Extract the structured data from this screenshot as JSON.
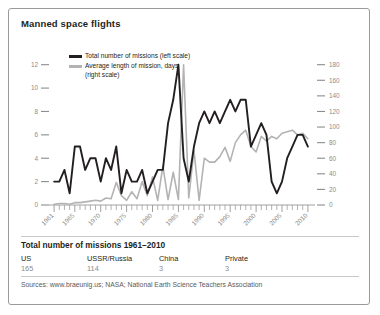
{
  "card": {
    "title": "Manned space flights"
  },
  "legend": {
    "series": [
      {
        "label": "Total number of missions (left scale)",
        "color": "#231f20",
        "swatch": "black"
      },
      {
        "label": "Average length of mission, days\n(right scale)",
        "color": "#b3b3b3",
        "swatch": "gray"
      }
    ]
  },
  "footer": {
    "summary_title": "Total number of missions 1961–2010",
    "columns": [
      {
        "label": "US",
        "value": "165"
      },
      {
        "label": "USSR/Russia",
        "value": "114"
      },
      {
        "label": "China",
        "value": "3"
      },
      {
        "label": "Private",
        "value": "3"
      }
    ],
    "sources": "Sources: www.braeunig.us; NASA; National Earth Science Teachers Association"
  },
  "chart_data": {
    "type": "line",
    "title": "Manned space flights",
    "xlabel": "",
    "ylabel": "",
    "grid": false,
    "legend_position": "top-left",
    "x": [
      1961,
      1962,
      1963,
      1964,
      1965,
      1966,
      1967,
      1968,
      1969,
      1970,
      1971,
      1972,
      1973,
      1974,
      1975,
      1976,
      1977,
      1978,
      1979,
      1980,
      1981,
      1982,
      1983,
      1984,
      1985,
      1986,
      1987,
      1988,
      1989,
      1990,
      1991,
      1992,
      1993,
      1994,
      1995,
      1996,
      1997,
      1998,
      1999,
      2000,
      2001,
      2002,
      2003,
      2004,
      2005,
      2006,
      2007,
      2008,
      2009,
      2010
    ],
    "xticks": [
      1961,
      1965,
      1970,
      1975,
      1980,
      1985,
      1990,
      1995,
      2000,
      2005,
      2010
    ],
    "xtick_labels": [
      "1961",
      "1965",
      "1970",
      "1975",
      "1980",
      "1985",
      "1990",
      "1995",
      "2000",
      "2005",
      "2010"
    ],
    "xlim": [
      1960.4,
      2010.6
    ],
    "axes": [
      {
        "name": "left",
        "label": "",
        "ylim": [
          0,
          13
        ],
        "yticks": [
          0,
          2,
          4,
          6,
          8,
          10,
          12
        ],
        "ytick_labels": [
          "0",
          "2",
          "4",
          "6",
          "8",
          "10",
          "12"
        ]
      },
      {
        "name": "right",
        "label": "",
        "ylim": [
          0,
          195
        ],
        "yticks": [
          0,
          20,
          40,
          60,
          80,
          100,
          120,
          140,
          160,
          180
        ],
        "ytick_labels": [
          "0",
          "20",
          "40",
          "60",
          "80",
          "100",
          "120",
          "140",
          "160",
          "180"
        ]
      }
    ],
    "series": [
      {
        "name": "Total number of missions (left scale)",
        "axis": "left",
        "color": "#231f20",
        "width": 1.9,
        "values": [
          2,
          2,
          3,
          1,
          5,
          5,
          3,
          4,
          4,
          2,
          4,
          3,
          5,
          1,
          3,
          2,
          2,
          3,
          1,
          2,
          3,
          3,
          7,
          9,
          12,
          4,
          2,
          5,
          7,
          8,
          7,
          8,
          7,
          8,
          9,
          8,
          9,
          9,
          5,
          6,
          7,
          6,
          2,
          1,
          2,
          4,
          5,
          6,
          6,
          5
        ]
      },
      {
        "name": "Average length of mission, days (right scale)",
        "axis": "right",
        "color": "#b3b3b3",
        "width": 1.6,
        "values": [
          1,
          2,
          2,
          1,
          3,
          3,
          4,
          5,
          6,
          5,
          9,
          8,
          29,
          12,
          6,
          17,
          8,
          30,
          12,
          36,
          6,
          50,
          7,
          42,
          7,
          180,
          9,
          70,
          6,
          60,
          55,
          55,
          62,
          74,
          56,
          80,
          90,
          96,
          75,
          68,
          88,
          82,
          88,
          85,
          92,
          94,
          96,
          90,
          92,
          85
        ]
      }
    ]
  }
}
